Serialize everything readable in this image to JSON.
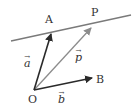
{
  "diagram": {
    "title": "",
    "colors": {
      "line": "#7a7a7a",
      "vector_dark": "#2a2a2a",
      "vector_p": "#8c8c8c",
      "text": "#333333"
    },
    "points": {
      "O": {
        "label": "O",
        "x": 34,
        "y": 90
      },
      "A": {
        "label": "A",
        "x": 51,
        "y": 33
      },
      "B": {
        "label": "B",
        "x": 92,
        "y": 78
      },
      "P": {
        "label": "P",
        "x": 91,
        "y": 27
      }
    },
    "line": {
      "x1": 11,
      "y1": 41,
      "x2": 131,
      "y2": 15,
      "description": "line through A and P"
    },
    "vectors": [
      {
        "name": "a",
        "label": "a",
        "arrow": "→",
        "from": "O",
        "to": "A"
      },
      {
        "name": "b",
        "label": "b",
        "arrow": "→",
        "from": "O",
        "to": "B"
      },
      {
        "name": "p",
        "label": "p",
        "arrow": "→",
        "from": "O",
        "to": "P"
      }
    ]
  }
}
